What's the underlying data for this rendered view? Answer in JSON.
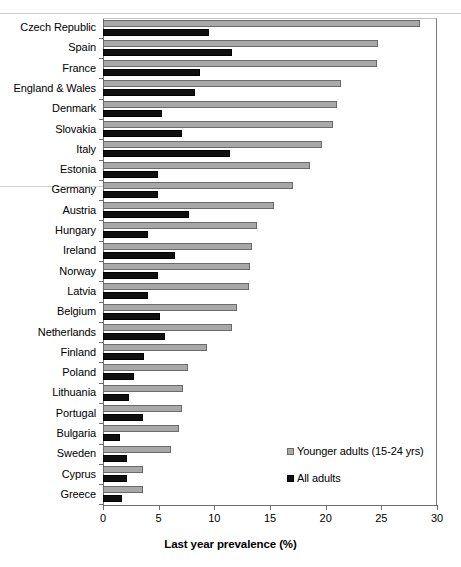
{
  "chart_data": {
    "type": "bar",
    "orientation": "horizontal",
    "title": "",
    "xlabel": "Last year prevalence (%)",
    "ylabel": "",
    "xlim": [
      0,
      30
    ],
    "xticks": [
      0,
      5,
      10,
      15,
      20,
      25,
      30
    ],
    "grid": false,
    "legend_position": "inside-bottom-right",
    "categories": [
      "Czech Republic",
      "Spain",
      "France",
      "England & Wales",
      "Denmark",
      "Slovakia",
      "Italy",
      "Estonia",
      "Germany",
      "Austria",
      "Hungary",
      "Ireland",
      "Norway",
      "Latvia",
      "Belgium",
      "Netherlands",
      "Finland",
      "Poland",
      "Lithuania",
      "Portugal",
      "Bulgaria",
      "Sweden",
      "Cyprus",
      "Greece"
    ],
    "series": [
      {
        "name": "Younger adults  (15-24 yrs)",
        "color": "#a8a8a8",
        "values": [
          28.5,
          24.7,
          24.6,
          21.4,
          21.0,
          20.7,
          19.7,
          18.6,
          17.1,
          15.4,
          13.8,
          13.4,
          13.2,
          13.1,
          12.0,
          11.6,
          9.3,
          7.6,
          7.2,
          7.1,
          6.8,
          6.1,
          3.6,
          3.6
        ]
      },
      {
        "name": "All adults",
        "color": "#101010",
        "values": [
          9.5,
          11.6,
          8.7,
          8.3,
          5.3,
          7.1,
          11.4,
          4.9,
          4.9,
          7.7,
          4.0,
          6.5,
          4.9,
          4.0,
          5.1,
          5.6,
          3.7,
          2.8,
          2.3,
          3.6,
          1.5,
          2.2,
          2.2,
          1.7
        ]
      }
    ]
  }
}
